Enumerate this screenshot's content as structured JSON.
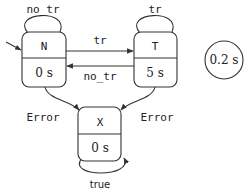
{
  "diagram": {
    "type": "state-machine",
    "states": [
      {
        "id": "N",
        "name": "N",
        "duration": "0 s",
        "initial": true
      },
      {
        "id": "T",
        "name": "T",
        "duration": "5 s",
        "initial": false
      },
      {
        "id": "X",
        "name": "X",
        "duration": "0 s",
        "initial": false
      }
    ],
    "transitions": [
      {
        "from": "N",
        "to": "N",
        "label": "no_tr"
      },
      {
        "from": "T",
        "to": "T",
        "label": "tr"
      },
      {
        "from": "N",
        "to": "T",
        "label": "tr"
      },
      {
        "from": "T",
        "to": "N",
        "label": "no_tr"
      },
      {
        "from": "N",
        "to": "X",
        "label": "Error"
      },
      {
        "from": "T",
        "to": "X",
        "label": "Error"
      },
      {
        "from": "X",
        "to": "X",
        "label": "true"
      }
    ],
    "period": "0.2 s"
  }
}
